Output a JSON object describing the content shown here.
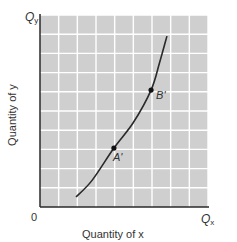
{
  "chart_data": {
    "type": "line",
    "title": "",
    "xlabel": "Quantity of x",
    "ylabel": "Quantity of y",
    "x_axis_end_label": "Q",
    "x_axis_end_sub": "x",
    "y_axis_end_label": "Q",
    "y_axis_end_sub": "y",
    "origin_label": "0",
    "grid": true,
    "grid_columns": 9,
    "grid_rows": 10,
    "xlim": [
      0,
      9
    ],
    "ylim": [
      0,
      10
    ],
    "tick_labels": "none (unlabeled axes)",
    "series": [
      {
        "name": "curve",
        "shape": "convex, increasing at an increasing rate",
        "x": [
          1.93,
          2.8,
          3.96,
          5.0,
          5.95,
          6.4,
          6.8
        ],
        "y": [
          0.52,
          1.4,
          3.07,
          4.4,
          6.09,
          7.5,
          8.9
        ]
      }
    ],
    "points": [
      {
        "label": "A'",
        "x": 3.96,
        "y": 3.07
      },
      {
        "label": "B'",
        "x": 5.95,
        "y": 6.09
      }
    ],
    "colors": {
      "plot_background": "#cfcfcf",
      "grid_lines": "#ffffff",
      "axes": "#2a2a2a",
      "curve": "#2a2a2a",
      "text": "#333333"
    }
  }
}
